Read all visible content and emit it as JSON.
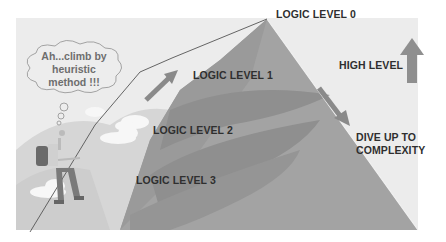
{
  "diagram": {
    "thought_bubble": {
      "line1": "Ah...climb by",
      "line2": "heuristic",
      "line3": "method !!!"
    },
    "levels": [
      {
        "label": "LOGIC LEVEL 0"
      },
      {
        "label": "LOGIC LEVEL 1"
      },
      {
        "label": "LOGIC LEVEL 2"
      },
      {
        "label": "LOGIC LEVEL 3"
      }
    ],
    "high_level_label": "HIGH LEVEL",
    "dive_label": {
      "line1": "DIVE UP TO",
      "line2": "COMPLEXITY"
    },
    "icons": [
      "up-arrow-icon",
      "diagonal-down-arrow-icon",
      "climb-arrow-icon",
      "climber-figure",
      "cloud-icon"
    ],
    "colors": {
      "background": "#ececec",
      "mountain": "#a3a3a3",
      "mountain_dark": "#8e8e8e",
      "arrow": "#8a8a8a",
      "text": "#2f2f2f"
    }
  }
}
